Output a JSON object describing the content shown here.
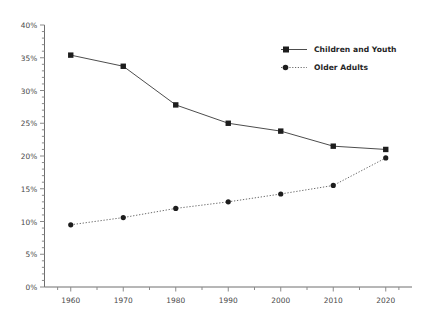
{
  "chart_data": {
    "type": "line",
    "title": "",
    "subtitle": "",
    "xlabel": "",
    "ylabel": "",
    "categories": [
      "1960",
      "1970",
      "1980",
      "1990",
      "2000",
      "2010",
      "2020"
    ],
    "x": [
      1960,
      1970,
      1980,
      1990,
      2000,
      2010,
      2020
    ],
    "xlim": [
      1955,
      2025
    ],
    "ylim": [
      0,
      40
    ],
    "y_tick_labels": [
      "0%",
      "5%",
      "10%",
      "15%",
      "20%",
      "25%",
      "30%",
      "35%",
      "40%"
    ],
    "y_tick_values": [
      0,
      5,
      10,
      15,
      20,
      25,
      30,
      35,
      40
    ],
    "y_minor_tick_step": 1,
    "grid": false,
    "legend_position": "top-right",
    "series": [
      {
        "name": "Children and Youth",
        "values": [
          35.4,
          33.7,
          27.8,
          25.0,
          23.8,
          21.5,
          21.0
        ],
        "color": "#4d4d4d",
        "line_style": "solid",
        "marker": "square"
      },
      {
        "name": "Older Adults",
        "values": [
          9.5,
          10.6,
          12.0,
          13.0,
          14.2,
          15.5,
          19.7
        ],
        "color": "#6b6b6b",
        "line_style": "dotted",
        "marker": "circle"
      }
    ]
  },
  "legend": {
    "items": [
      {
        "label": "Children and Youth"
      },
      {
        "label": "Older Adults"
      }
    ]
  },
  "axes": {
    "axis_color": "#6e6e6e",
    "tick_color": "#8a8a8a",
    "label_color": "#4a4a4a"
  }
}
